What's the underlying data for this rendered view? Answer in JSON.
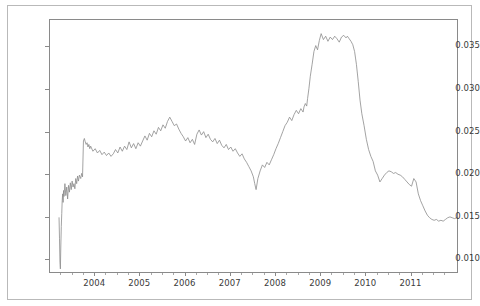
{
  "chart_data": {
    "type": "line",
    "title": "",
    "xlabel": "",
    "ylabel": "",
    "xlim": [
      2003.0,
      2012.05
    ],
    "ylim": [
      0.0084,
      0.0382
    ],
    "grid": false,
    "legend": null,
    "line_color": "#8c8c8c",
    "line_width": 0.8,
    "background_color": "#ffffff",
    "frame_color": "#8a8a8a",
    "outer_frame_color": "#b9b9b9",
    "x_ticks": [
      2004,
      2005,
      2006,
      2007,
      2008,
      2009,
      2010,
      2011
    ],
    "x_tick_labels": [
      "2004",
      "2005",
      "2006",
      "2007",
      "2008",
      "2009",
      "2010",
      "2011"
    ],
    "y_ticks": [
      0.01,
      0.015,
      0.02,
      0.025,
      0.03,
      0.035
    ],
    "y_tick_labels": [
      "0.010",
      "0.015",
      "0.020",
      "0.025",
      "0.030",
      "0.035"
    ],
    "series": [
      {
        "name": "series-1",
        "color": "#8c8c8c",
        "x": [
          2003.2,
          2003.21,
          2003.22,
          2003.23,
          2003.24,
          2003.25,
          2003.26,
          2003.27,
          2003.28,
          2003.29,
          2003.3,
          2003.31,
          2003.33,
          2003.35,
          2003.37,
          2003.39,
          2003.41,
          2003.43,
          2003.45,
          2003.47,
          2003.49,
          2003.51,
          2003.53,
          2003.55,
          2003.57,
          2003.59,
          2003.61,
          2003.63,
          2003.65,
          2003.68,
          2003.7,
          2003.72,
          2003.74,
          2003.76,
          2003.78,
          2003.8,
          2003.82,
          2003.84,
          2003.86,
          2003.88,
          2003.9,
          2003.95,
          2004.0,
          2004.05,
          2004.1,
          2004.15,
          2004.2,
          2004.25,
          2004.3,
          2004.35,
          2004.4,
          2004.45,
          2004.5,
          2004.55,
          2004.6,
          2004.65,
          2004.7,
          2004.75,
          2004.8,
          2004.85,
          2004.9,
          2004.95,
          2005.0,
          2005.05,
          2005.1,
          2005.15,
          2005.2,
          2005.25,
          2005.3,
          2005.35,
          2005.4,
          2005.45,
          2005.5,
          2005.55,
          2005.6,
          2005.65,
          2005.7,
          2005.75,
          2005.8,
          2005.85,
          2005.9,
          2005.95,
          2006.0,
          2006.05,
          2006.1,
          2006.15,
          2006.2,
          2006.25,
          2006.3,
          2006.35,
          2006.4,
          2006.45,
          2006.5,
          2006.55,
          2006.6,
          2006.65,
          2006.7,
          2006.75,
          2006.8,
          2006.85,
          2006.9,
          2006.95,
          2007.0,
          2007.05,
          2007.1,
          2007.15,
          2007.2,
          2007.25,
          2007.3,
          2007.35,
          2007.4,
          2007.45,
          2007.5,
          2007.53,
          2007.56,
          2007.6,
          2007.65,
          2007.7,
          2007.75,
          2007.8,
          2007.85,
          2007.9,
          2007.95,
          2008.0,
          2008.05,
          2008.1,
          2008.15,
          2008.2,
          2008.25,
          2008.3,
          2008.35,
          2008.4,
          2008.45,
          2008.5,
          2008.55,
          2008.6,
          2008.62,
          2008.65,
          2008.68,
          2008.7,
          2008.73,
          2008.76,
          2008.8,
          2008.84,
          2008.88,
          2008.92,
          2008.96,
          2009.0,
          2009.05,
          2009.1,
          2009.15,
          2009.2,
          2009.25,
          2009.3,
          2009.35,
          2009.4,
          2009.45,
          2009.5,
          2009.55,
          2009.58,
          2009.62,
          2009.66,
          2009.7,
          2009.74,
          2009.78,
          2009.82,
          2009.86,
          2009.9,
          2009.95,
          2010.0,
          2010.05,
          2010.1,
          2010.15,
          2010.2,
          2010.25,
          2010.3,
          2010.35,
          2010.4,
          2010.45,
          2010.5,
          2010.55,
          2010.6,
          2010.65,
          2010.7,
          2010.75,
          2010.8,
          2010.85,
          2010.9,
          2010.95,
          2011.0,
          2011.05,
          2011.1,
          2011.15,
          2011.2,
          2011.25,
          2011.3,
          2011.35,
          2011.4,
          2011.45,
          2011.5,
          2011.55,
          2011.6,
          2011.65,
          2011.7,
          2011.75,
          2011.8,
          2011.85,
          2011.9,
          2011.95,
          2012.0
        ],
        "y": [
          0.015,
          0.0126,
          0.0098,
          0.009,
          0.0118,
          0.014,
          0.0155,
          0.017,
          0.0178,
          0.0168,
          0.0182,
          0.0175,
          0.019,
          0.0176,
          0.0186,
          0.0172,
          0.0188,
          0.018,
          0.0191,
          0.0183,
          0.0193,
          0.0186,
          0.019,
          0.0184,
          0.0196,
          0.019,
          0.0199,
          0.0193,
          0.02,
          0.0196,
          0.0202,
          0.0198,
          0.024,
          0.0243,
          0.0239,
          0.0236,
          0.0238,
          0.0233,
          0.0236,
          0.0231,
          0.0234,
          0.0228,
          0.0231,
          0.0226,
          0.0229,
          0.0224,
          0.0227,
          0.0223,
          0.0226,
          0.0222,
          0.0225,
          0.023,
          0.0226,
          0.0233,
          0.0228,
          0.0234,
          0.023,
          0.0239,
          0.0232,
          0.0237,
          0.0231,
          0.0238,
          0.0234,
          0.024,
          0.0246,
          0.0241,
          0.0249,
          0.0245,
          0.0252,
          0.0248,
          0.0256,
          0.0252,
          0.0259,
          0.0255,
          0.0263,
          0.0268,
          0.0263,
          0.0258,
          0.026,
          0.0254,
          0.0249,
          0.0245,
          0.024,
          0.0244,
          0.0238,
          0.0242,
          0.0236,
          0.0248,
          0.0253,
          0.0247,
          0.0251,
          0.0244,
          0.0248,
          0.0242,
          0.0239,
          0.0243,
          0.0237,
          0.0241,
          0.0235,
          0.0232,
          0.0236,
          0.023,
          0.0233,
          0.0228,
          0.0231,
          0.0226,
          0.0222,
          0.0225,
          0.0219,
          0.0215,
          0.021,
          0.0205,
          0.0198,
          0.019,
          0.0183,
          0.0196,
          0.0205,
          0.0212,
          0.0209,
          0.0215,
          0.0212,
          0.0218,
          0.0224,
          0.0231,
          0.0237,
          0.0244,
          0.0251,
          0.0258,
          0.0262,
          0.0268,
          0.0264,
          0.0271,
          0.0276,
          0.0272,
          0.0278,
          0.0274,
          0.028,
          0.0284,
          0.0281,
          0.029,
          0.0302,
          0.0316,
          0.033,
          0.0345,
          0.0352,
          0.0347,
          0.0358,
          0.0366,
          0.0359,
          0.0363,
          0.0357,
          0.0362,
          0.0359,
          0.0363,
          0.036,
          0.0356,
          0.0362,
          0.0364,
          0.0361,
          0.0363,
          0.036,
          0.0357,
          0.0353,
          0.0345,
          0.033,
          0.031,
          0.0288,
          0.0272,
          0.0258,
          0.0242,
          0.023,
          0.0222,
          0.0216,
          0.0205,
          0.02,
          0.0192,
          0.0196,
          0.02,
          0.0203,
          0.0205,
          0.0204,
          0.0202,
          0.0203,
          0.0201,
          0.02,
          0.0198,
          0.0195,
          0.0192,
          0.0189,
          0.0187,
          0.0196,
          0.0192,
          0.0178,
          0.017,
          0.0164,
          0.0158,
          0.0153,
          0.015,
          0.0148,
          0.0147,
          0.0148,
          0.0146,
          0.0147,
          0.0146,
          0.0148,
          0.015,
          0.0151,
          0.015,
          0.0149,
          0.015
        ]
      }
    ]
  }
}
